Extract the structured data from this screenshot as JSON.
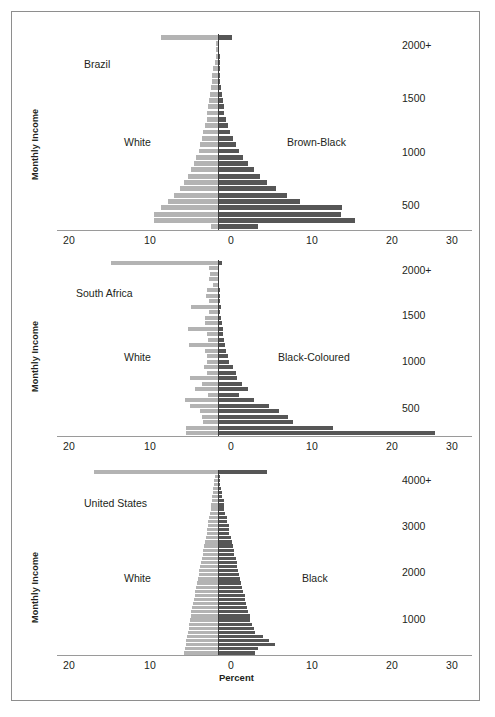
{
  "figure": {
    "x_axis_title": "Percent",
    "y_axis_title": "Monthly Income",
    "colors": {
      "left_series": "#b3b3b3",
      "right_series": "#565656",
      "axis": "#9a9a9a",
      "center": "#3a3a3a",
      "text": "#231f20",
      "frame": "#8e8e8e"
    }
  },
  "chart_data": [
    {
      "type": "bar",
      "title": "Brazil",
      "subtype": "population-pyramid",
      "xlabel": "Percent",
      "ylabel": "Monthly Income",
      "xlim": [
        -20,
        30
      ],
      "xticks": [
        20,
        10,
        0,
        10,
        20,
        30
      ],
      "xtick_signed": [
        -20,
        -10,
        0,
        10,
        20,
        30
      ],
      "yticks": [
        "2000+",
        "1500",
        "1000",
        "500"
      ],
      "grid": false,
      "legend": "inline-labels",
      "left_label": "White",
      "right_label": "Brown-Black",
      "series": [
        {
          "name": "White",
          "side": "left",
          "color": "#b3b3b3",
          "values": [
            7.0,
            0.2,
            0.3,
            0.3,
            0.4,
            0.6,
            0.7,
            0.8,
            0.9,
            1.0,
            1.1,
            1.2,
            1.3,
            1.4,
            1.6,
            1.8,
            2.0,
            2.2,
            2.4,
            2.7,
            3.0,
            3.3,
            3.7,
            4.2,
            4.7,
            5.4,
            6.2,
            7.0,
            7.9,
            7.9,
            0.9
          ]
        },
        {
          "name": "Brown-Black",
          "side": "right",
          "color": "#565656",
          "values": [
            1.7,
            0.1,
            0.1,
            0.2,
            0.2,
            0.2,
            0.3,
            0.3,
            0.4,
            0.5,
            0.6,
            0.7,
            0.8,
            1.0,
            1.2,
            1.5,
            1.8,
            2.2,
            2.6,
            3.1,
            3.7,
            4.4,
            5.2,
            6.1,
            7.2,
            8.5,
            10.1,
            15.4,
            15.2,
            17.0,
            5.0
          ]
        }
      ]
    },
    {
      "type": "bar",
      "title": "South Africa",
      "subtype": "population-pyramid",
      "xlabel": "Percent",
      "ylabel": "Monthly Income",
      "xlim": [
        -20,
        30
      ],
      "xticks": [
        20,
        10,
        0,
        10,
        20,
        30
      ],
      "xtick_signed": [
        -20,
        -10,
        0,
        10,
        20,
        30
      ],
      "yticks": [
        "2000+",
        "1500",
        "1000",
        "500"
      ],
      "grid": false,
      "legend": "inline-labels",
      "left_label": "White",
      "right_label": "Black-Coloured",
      "series": [
        {
          "name": "White",
          "side": "left",
          "color": "#b3b3b3",
          "values": [
            13.2,
            1.1,
            1.0,
            1.1,
            0.6,
            1.4,
            1.5,
            1.1,
            3.3,
            1.1,
            1.6,
            1.6,
            3.7,
            1.3,
            1.2,
            3.6,
            1.6,
            1.3,
            1.3,
            1.7,
            1.4,
            3.5,
            2.0,
            2.9,
            1.2,
            4.1,
            3.5,
            2.2,
            2.0,
            1.8,
            3.9,
            3.9
          ]
        },
        {
          "name": "Black-Coloured",
          "side": "right",
          "color": "#565656",
          "values": [
            0.5,
            0.1,
            0.1,
            0.1,
            0.1,
            0.2,
            0.2,
            0.3,
            0.4,
            0.3,
            0.4,
            0.5,
            0.6,
            0.6,
            0.8,
            0.9,
            1.0,
            1.2,
            1.4,
            1.9,
            2.2,
            2.3,
            3.0,
            3.7,
            2.6,
            4.5,
            6.3,
            7.5,
            8.7,
            9.3,
            14.2,
            26.8
          ]
        }
      ]
    },
    {
      "type": "bar",
      "title": "United States",
      "subtype": "population-pyramid",
      "xlabel": "Percent",
      "ylabel": "Monthly Income",
      "xlim": [
        -20,
        30
      ],
      "xticks": [
        20,
        10,
        0,
        10,
        20,
        30
      ],
      "xtick_signed": [
        -20,
        -10,
        0,
        10,
        20,
        30
      ],
      "yticks": [
        "4000+",
        "3000",
        "2000",
        "1000"
      ],
      "grid": false,
      "legend": "inline-labels",
      "left_label": "White",
      "right_label": "Black",
      "series": [
        {
          "name": "White",
          "side": "left",
          "color": "#b3b3b3",
          "values": [
            15.3,
            0.4,
            0.5,
            0.5,
            0.6,
            0.6,
            0.7,
            0.8,
            0.9,
            0.9,
            1.0,
            1.1,
            1.2,
            1.2,
            1.4,
            1.4,
            1.5,
            1.6,
            1.7,
            1.8,
            1.9,
            2.0,
            2.1,
            2.2,
            2.3,
            2.4,
            2.5,
            2.6,
            2.7,
            2.8,
            2.9,
            3.0,
            3.1,
            3.2,
            3.3,
            3.4,
            3.5,
            3.6,
            3.6,
            3.7,
            3.8,
            3.9,
            4.0,
            4.1,
            4.2
          ]
        },
        {
          "name": "Black",
          "side": "right",
          "color": "#565656",
          "values": [
            6.1,
            0.2,
            0.3,
            0.3,
            0.4,
            0.5,
            0.5,
            0.7,
            0.8,
            0.8,
            0.9,
            1.1,
            1.1,
            1.3,
            1.4,
            1.4,
            1.6,
            1.7,
            1.8,
            2.0,
            2.0,
            2.2,
            2.3,
            2.4,
            2.5,
            2.6,
            2.7,
            2.9,
            3.0,
            3.1,
            3.3,
            3.4,
            3.5,
            3.6,
            3.7,
            3.9,
            4.0,
            4.2,
            4.4,
            4.6,
            5.6,
            6.3,
            7.1,
            5.0,
            4.6
          ]
        }
      ]
    }
  ]
}
